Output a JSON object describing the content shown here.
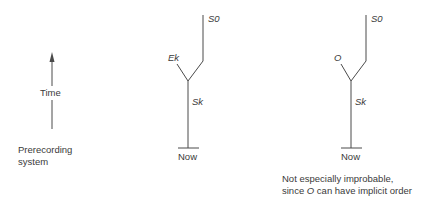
{
  "left_panel": {
    "axis_label": "Time",
    "caption_line1": "Prerecording",
    "caption_line2": "system"
  },
  "middle_panel": {
    "top_label": "S0",
    "branch_label": "Ek",
    "stem_label": "Sk",
    "bottom_label": "Now"
  },
  "right_panel": {
    "top_label": "S0",
    "branch_label": "O",
    "stem_label": "Sk",
    "bottom_label": "Now",
    "caption_line1": "Not especially improbable,",
    "caption_line2_pre": "since ",
    "caption_line2_italic": "O",
    "caption_line2_post": " can have implicit order"
  },
  "colors": {
    "line": "#4a4a4a",
    "text": "#3a3a3a",
    "background": "#ffffff"
  }
}
